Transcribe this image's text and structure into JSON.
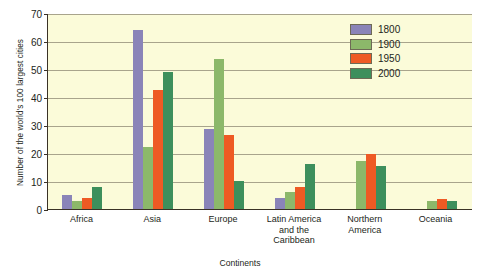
{
  "chart_data": {
    "type": "bar",
    "title": "",
    "xlabel": "Continents",
    "ylabel": "Number of the world's 100 largest cities",
    "ylim": [
      0,
      70
    ],
    "ytick_step": 10,
    "yticks": [
      0,
      10,
      20,
      30,
      40,
      50,
      60,
      70
    ],
    "grid": true,
    "legend_position": "top-right",
    "categories": [
      "Africa",
      "Asia",
      "Europe",
      "Latin America\nand the\nCaribbean",
      "Northern\nAmerica",
      "Oceania"
    ],
    "series": [
      {
        "name": "1800",
        "color": "#8a84b8",
        "values": [
          5,
          64,
          28.5,
          4,
          0,
          0
        ]
      },
      {
        "name": "1900",
        "color": "#8cb86a",
        "values": [
          3,
          22,
          53.5,
          6,
          17,
          3
        ]
      },
      {
        "name": "1950",
        "color": "#ee5a24",
        "values": [
          4,
          42.5,
          26.5,
          8,
          19.5,
          3.5
        ]
      },
      {
        "name": "2000",
        "color": "#3d8f5c",
        "values": [
          8,
          49,
          10,
          16,
          15.5,
          3
        ]
      }
    ]
  },
  "colors": {
    "plot_background": "#fbfbd9",
    "axis": "#3a3226",
    "gridline": "#a8a48c",
    "page_background": "#ffffff"
  }
}
